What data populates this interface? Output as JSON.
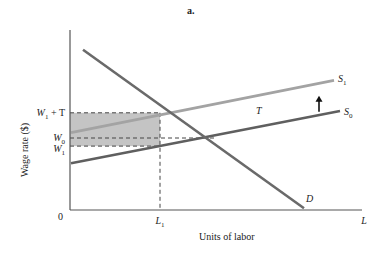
{
  "chart_data": {
    "type": "line",
    "title": "a.",
    "xlabel": "Units of labor",
    "ylabel": "Wage rate ($)",
    "xlim": [
      0,
      10
    ],
    "ylim": [
      0,
      10
    ],
    "origin_label": "0",
    "x_ticks": [
      {
        "label": "L",
        "sub": "1",
        "x": 3.0
      },
      {
        "label": "L",
        "sub": "",
        "x": 9.8
      }
    ],
    "y_ticks": [
      {
        "label": "W",
        "sub": "1",
        "suffix": " + T",
        "y": 5.4
      },
      {
        "label": "W",
        "sub": "0",
        "suffix": "",
        "y": 4.0
      },
      {
        "label": "W",
        "sub": "1",
        "suffix": "",
        "y": 3.55
      }
    ],
    "series": [
      {
        "name": "S",
        "sub": "1",
        "color": "#a3a3a3",
        "points": [
          [
            0,
            4.3
          ],
          [
            8.8,
            7.2
          ]
        ]
      },
      {
        "name": "S",
        "sub": "0",
        "color": "#5f5f5f",
        "points": [
          [
            0,
            2.6
          ],
          [
            9.0,
            5.5
          ]
        ]
      },
      {
        "name": "D",
        "sub": "",
        "color": "#6a6a6a",
        "points": [
          [
            0.4,
            8.9
          ],
          [
            7.8,
            0.1
          ]
        ]
      }
    ],
    "shaded_region": {
      "x": [
        0,
        3.0
      ],
      "y": [
        3.55,
        5.4
      ],
      "color": "#c4c4c4"
    },
    "annotations": [
      {
        "text": "T",
        "x": 6.2,
        "y": 5.5
      },
      {
        "text": "up-arrow",
        "x": 8.3,
        "y": 5.9
      }
    ]
  }
}
